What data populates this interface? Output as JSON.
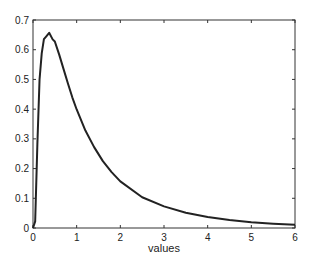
{
  "chart_data": {
    "type": "line",
    "title": "",
    "xlabel": "values",
    "ylabel": "",
    "xlim": [
      0,
      6
    ],
    "ylim": [
      0,
      0.7
    ],
    "grid": false,
    "legend": null,
    "xticks": [
      "0",
      "1",
      "2",
      "3",
      "4",
      "5",
      "6"
    ],
    "yticks": [
      "0",
      "0.1",
      "0.2",
      "0.3",
      "0.4",
      "0.5",
      "0.6",
      "0.7"
    ],
    "series": [
      {
        "name": "density",
        "color": "#222222",
        "x": [
          0,
          0.05,
          0.1,
          0.15,
          0.2,
          0.25,
          0.3,
          0.37,
          0.45,
          0.5,
          0.6,
          0.7,
          0.8,
          0.9,
          1.0,
          1.2,
          1.4,
          1.6,
          1.8,
          2.0,
          2.5,
          3.0,
          3.5,
          4.0,
          4.5,
          5.0,
          5.5,
          6.0
        ],
        "y": [
          0,
          0.0223,
          0.2816,
          0.4999,
          0.5879,
          0.6356,
          0.6444,
          0.6569,
          0.6347,
          0.6275,
          0.5835,
          0.5347,
          0.4864,
          0.4398,
          0.3989,
          0.328,
          0.2721,
          0.225,
          0.1881,
          0.1569,
          0.1034,
          0.0727,
          0.0514,
          0.0367,
          0.0266,
          0.0195,
          0.0145,
          0.0108
        ]
      }
    ]
  }
}
